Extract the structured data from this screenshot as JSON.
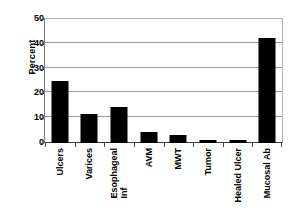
{
  "chart_data": {
    "type": "bar",
    "title": "",
    "xlabel": "",
    "ylabel": "Percent",
    "ylim": [
      0,
      50
    ],
    "yticks": [
      0,
      10,
      20,
      30,
      40,
      50
    ],
    "ytick_labels": [
      "0",
      "10",
      "20",
      "30",
      "40",
      "50"
    ],
    "grid": true,
    "legend": false,
    "bar_color": "#000000",
    "categories": [
      "Ulcers",
      "Varices",
      "Esophageal Inf",
      "AVM",
      "MWT",
      "Tumor",
      "Healed Ulcer",
      "Mucosal Ab"
    ],
    "category_lines": [
      [
        "Ulcers"
      ],
      [
        "Varices"
      ],
      [
        "Esophageal",
        "Inf"
      ],
      [
        "AVM"
      ],
      [
        "MWT"
      ],
      [
        "Tumor"
      ],
      [
        "Healed Ulcer"
      ],
      [
        "Mucosal Ab"
      ]
    ],
    "values": [
      25.0,
      11.6,
      14.5,
      4.5,
      3.2,
      1.3,
      1.2,
      42.5
    ]
  },
  "axis": {
    "y_title": "Percent"
  }
}
